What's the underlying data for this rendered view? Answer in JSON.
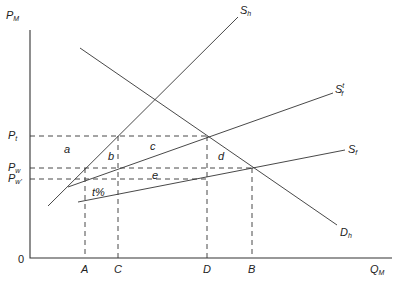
{
  "axes": {
    "y_label": "P",
    "y_label_sub": "M",
    "x_label": "Q",
    "x_label_sub": "M",
    "origin": "0"
  },
  "price_labels": [
    {
      "main": "P",
      "sub": "t",
      "y": 136
    },
    {
      "main": "P",
      "sub": "w",
      "y": 168
    },
    {
      "main": "P",
      "sub": "w'",
      "y": 179
    }
  ],
  "quantity_labels": [
    {
      "text": "A",
      "x": 85
    },
    {
      "text": "C",
      "x": 118
    },
    {
      "text": "D",
      "x": 207
    },
    {
      "text": "B",
      "x": 252
    }
  ],
  "curves": [
    {
      "id": "Sh",
      "main": "S",
      "sub": "h",
      "sup": "",
      "x1": 48,
      "y1": 206,
      "x2": 238,
      "y2": 17,
      "lx": 240,
      "ly": 14
    },
    {
      "id": "Sf_tariff",
      "main": "S",
      "sub": "f",
      "sup": "t",
      "x1": 68,
      "y1": 187,
      "x2": 333,
      "y2": 93,
      "lx": 335,
      "ly": 93
    },
    {
      "id": "Sf",
      "main": "S",
      "sub": "f",
      "sup": "",
      "x1": 78,
      "y1": 202,
      "x2": 345,
      "y2": 150,
      "lx": 348,
      "ly": 153
    },
    {
      "id": "Dh",
      "main": "D",
      "sub": "h",
      "sup": "",
      "x1": 80,
      "y1": 48,
      "x2": 337,
      "y2": 225,
      "lx": 340,
      "ly": 236
    }
  ],
  "dashed_lines": [
    {
      "x1": 30,
      "y1": 136,
      "x2": 207,
      "y2": 136
    },
    {
      "x1": 30,
      "y1": 168,
      "x2": 252,
      "y2": 168
    },
    {
      "x1": 30,
      "y1": 179,
      "x2": 207,
      "y2": 179
    },
    {
      "x1": 85,
      "y1": 168,
      "x2": 85,
      "y2": 258
    },
    {
      "x1": 118,
      "y1": 136,
      "x2": 118,
      "y2": 258
    },
    {
      "x1": 207,
      "y1": 136,
      "x2": 207,
      "y2": 258
    },
    {
      "x1": 252,
      "y1": 168,
      "x2": 252,
      "y2": 258
    }
  ],
  "area_labels": [
    {
      "text": "a",
      "x": 64,
      "y": 153
    },
    {
      "text": "b",
      "x": 108,
      "y": 160
    },
    {
      "text": "c",
      "x": 150,
      "y": 150
    },
    {
      "text": "d",
      "x": 218,
      "y": 160
    },
    {
      "text": "e",
      "x": 152,
      "y": 179
    },
    {
      "text": "t%",
      "x": 92,
      "y": 196
    }
  ]
}
